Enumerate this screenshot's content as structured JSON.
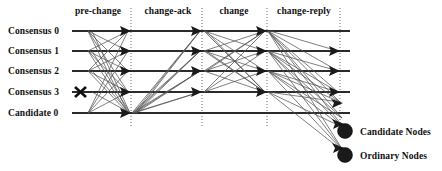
{
  "figure": {
    "type": "message-sequence-diagram",
    "background": "#ffffff",
    "line_color": "#2b2b2b",
    "message_color": "#555555",
    "divider_color": "#6b6b6b"
  },
  "phases": [
    {
      "label": "pre-change",
      "x": 98
    },
    {
      "label": "change-ack",
      "x": 168
    },
    {
      "label": "change",
      "x": 234
    },
    {
      "label": "change-reply",
      "x": 304
    }
  ],
  "dividers": [
    {
      "name": "divider-1",
      "x": 131
    },
    {
      "name": "divider-2",
      "x": 202
    },
    {
      "name": "divider-3",
      "x": 267
    },
    {
      "name": "divider-4",
      "x": 340
    }
  ],
  "participants": [
    {
      "label": "Consensus 0",
      "y": 31,
      "failed": false,
      "kind": "consensus"
    },
    {
      "label": "Consensus 1",
      "y": 51,
      "failed": false,
      "kind": "consensus"
    },
    {
      "label": "Consensus 2",
      "y": 71,
      "failed": false,
      "kind": "consensus"
    },
    {
      "label": "Consensus 3",
      "y": 92,
      "failed": true,
      "kind": "consensus"
    },
    {
      "label": "Candidate 0",
      "y": 113,
      "failed": false,
      "kind": "candidate"
    }
  ],
  "legend": [
    {
      "label": "Candidate Nodes",
      "symbol": "filled-circle",
      "cx": 345,
      "cy": 131
    },
    {
      "label": "Ordinary Nodes",
      "symbol": "filled-circle",
      "cx": 345,
      "cy": 155
    }
  ],
  "failure_marker": {
    "name": "crossed-out-node",
    "x": 80,
    "y": 92,
    "participant": "Consensus 3"
  }
}
